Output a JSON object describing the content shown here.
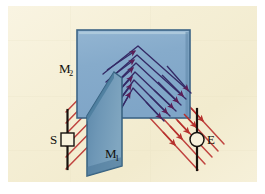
{
  "figure": {
    "type": "optics-ray-diagram",
    "canvas": {
      "width": 265,
      "height": 194
    },
    "background_color": "#F7F2DC",
    "plate_margin_color": "#FFFFFF",
    "plate": {
      "x": 8,
      "y": 6,
      "width": 249,
      "height": 176
    }
  },
  "colors": {
    "background": "#F7F2DC",
    "background_mottle": "#EFE8CC",
    "mirror2_fill": "#86ABCB",
    "mirror2_edge": "#3C6486",
    "mirror2_top_highlight": "#A9C6DC",
    "mirror1_fill": "#6E97B6",
    "mirror1_edge": "#3A5F7F",
    "mirror1_face_dark": "#5C8AAC",
    "ray_red": "#C0443F",
    "ray_red_light": "#D46A63",
    "ray_dark": "#3A2E6E",
    "arrow_purple": "#5B1E56",
    "arrow_red": "#B7322E",
    "stand_black": "#15120E",
    "label_text": "#12100C"
  },
  "labels": {
    "mirror2": {
      "text": "M",
      "sub": "2",
      "x": 59,
      "y": 73,
      "name": "label-m2"
    },
    "mirror1": {
      "text": "M",
      "sub": "1",
      "x": 105,
      "y": 158,
      "name": "label-m1"
    },
    "source": {
      "text": "S",
      "x": 52,
      "y": 142,
      "name": "label-s"
    },
    "eye": {
      "text": "E",
      "x": 206,
      "y": 142,
      "name": "label-e"
    }
  },
  "source_marker": {
    "name": "source-slit",
    "shape": "square",
    "x": 61,
    "y": 133,
    "width": 13,
    "height": 13,
    "post": {
      "x": 67.5,
      "y_top": 111,
      "y_bottom": 168
    }
  },
  "eye_marker": {
    "name": "eye-detector",
    "shape": "circle",
    "cx": 197,
    "cy": 139.5,
    "r": 7,
    "post": {
      "x": 197,
      "y_top": 110,
      "y_bottom": 168
    }
  },
  "mirror2": {
    "name": "mirror-m2-plane",
    "points": "77,30 190,30 190,118 77,118",
    "description": "Large light blue rectangular mirror plane (back mirror)"
  },
  "mirror1": {
    "name": "mirror-m1-plane",
    "points": "113,73 120,78 120,167 86,175 86,117",
    "description": "Darker blue angled mirror plate standing in front"
  },
  "ray_paths": {
    "incident_count": 5,
    "emergent_count": 5,
    "chevron_count": 6,
    "description": "Red rays enter from the source S at lower-left, reflect repeatedly between M1 and M2 forming nested chevrons, then emerge at lower-right toward the eye E"
  },
  "incident_rays": [
    {
      "x1": 67,
      "y1": 168,
      "x2": 113,
      "y2": 118
    },
    {
      "x1": 67,
      "y1": 157,
      "x2": 110,
      "y2": 110
    },
    {
      "x1": 67,
      "y1": 146,
      "x2": 108,
      "y2": 102
    },
    {
      "x1": 67,
      "y1": 135,
      "x2": 106,
      "y2": 93
    },
    {
      "x1": 67,
      "y1": 123,
      "x2": 104,
      "y2": 84
    },
    {
      "x1": 67,
      "y1": 112,
      "x2": 102,
      "y2": 75
    }
  ],
  "emergent_rays": [
    {
      "x1": 160,
      "y1": 112,
      "x2": 197,
      "y2": 152
    },
    {
      "x1": 165,
      "y1": 107,
      "x2": 205,
      "y2": 150
    },
    {
      "x1": 170,
      "y1": 103,
      "x2": 212,
      "y2": 148
    },
    {
      "x1": 176,
      "y1": 99,
      "x2": 218,
      "y2": 145
    },
    {
      "x1": 182,
      "y1": 96,
      "x2": 222,
      "y2": 139
    }
  ],
  "chevrons": [
    {
      "left": "108,108 132,79",
      "apex": "132,79",
      "right": "132,79 167,117"
    },
    {
      "left": "106,100 133,71",
      "apex": "133,71",
      "right": "133,71 172,110"
    },
    {
      "left": "104,92  134,63",
      "apex": "134,63",
      "right": "134,63 176,104"
    },
    {
      "left": "102,84  135,55",
      "apex": "135,55",
      "right": "135,55 180,98"
    },
    {
      "left": "100,76  136,48",
      "apex": "136,48",
      "right": "136,48 184,92"
    },
    {
      "left": "113,118 131,87",
      "apex": "131,87",
      "right": "131,87 162,123"
    }
  ],
  "arrowheads": {
    "internal_color": "#5B1E56",
    "emergent_color": "#B7322E",
    "internal_positions": [
      {
        "x": 126,
        "y": 84
      },
      {
        "x": 127,
        "y": 76
      },
      {
        "x": 128,
        "y": 68
      },
      {
        "x": 129,
        "y": 60
      },
      {
        "x": 130,
        "y": 52
      },
      {
        "x": 160,
        "y": 110
      },
      {
        "x": 165,
        "y": 104
      },
      {
        "x": 169,
        "y": 98
      },
      {
        "x": 173,
        "y": 92
      },
      {
        "x": 177,
        "y": 86
      }
    ]
  }
}
